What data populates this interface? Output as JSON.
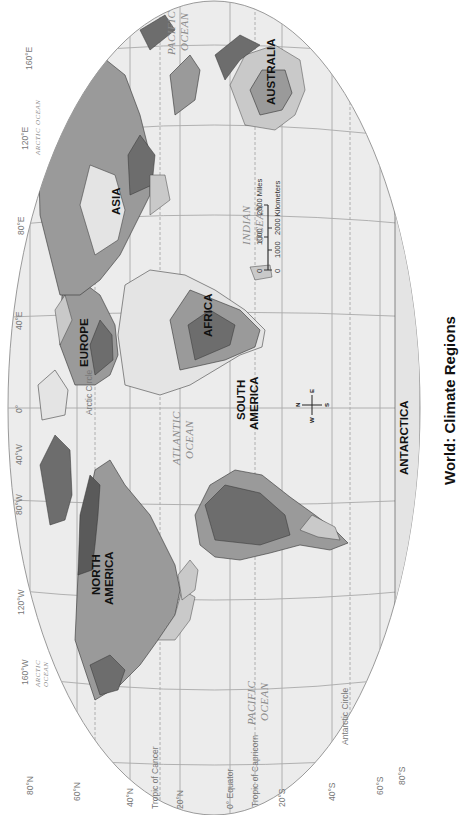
{
  "title": "World: Climate Regions",
  "orientation": "rotated 90° clockwise (north points left)",
  "continents": {
    "north_america": [
      "NORTH",
      "AMERICA"
    ],
    "south_america": [
      "SOUTH",
      "AMERICA"
    ],
    "europe": "EUROPE",
    "asia": "ASIA",
    "africa": "AFRICA",
    "australia": "AUSTRALIA",
    "antarctica": "ANTARCTICA"
  },
  "oceans": {
    "pacific_west": [
      "PACIFIC",
      "OCEAN"
    ],
    "pacific_east": [
      "PACIFIC",
      "OCEAN"
    ],
    "atlantic": [
      "ATLANTIC",
      "OCEAN"
    ],
    "indian": [
      "INDIAN",
      "OCEAN"
    ],
    "arctic_west": [
      "ARCTIC",
      "OCEAN"
    ],
    "arctic_east": [
      "ARCTIC",
      "OCEAN"
    ]
  },
  "latitude_labels": {
    "n80": "80°N",
    "n60": "60°N",
    "n40": "40°N",
    "n20": "20°N",
    "eq": "0° Equator",
    "s20": "20°S",
    "s40": "40°S",
    "s60": "60°S",
    "s80": "80°S",
    "tropic_cancer": "Tropic of Cancer",
    "tropic_capricorn": "Tropic of Capricorn",
    "arctic_circle": "Arctic Circle",
    "antarctic_circle": "Antarctic Circle"
  },
  "longitude_labels": {
    "w160": "160°W",
    "w120": "120°W",
    "w80": "80°W",
    "w40": "40°W",
    "zero": "0°",
    "e40": "40°E",
    "e80": "80°E",
    "e120": "120°E",
    "e160": "160°E"
  },
  "scale_bar": {
    "miles_label": "2000 Miles",
    "km_label": "2000 Kilometers",
    "ticks_top": [
      "0",
      "1000"
    ],
    "ticks_bottom": [
      "0",
      "1000"
    ]
  },
  "compass": {
    "n": "N",
    "e": "E",
    "s": "S",
    "w": "W"
  },
  "colors": {
    "ocean": "#ececec",
    "graticule": "#a9a9a9",
    "land_light": "#c9c9c9",
    "land_mid": "#9a9a9a",
    "land_dark": "#6d6d6d",
    "land_darkest": "#5a5a5a",
    "ice": "#e4e4e4"
  }
}
